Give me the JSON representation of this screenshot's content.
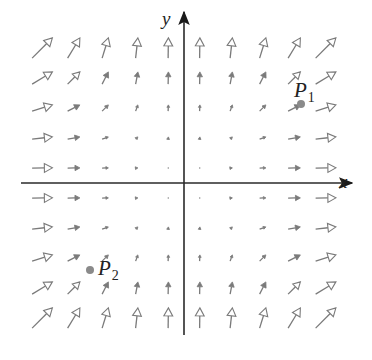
{
  "diagram": {
    "type": "vector_field",
    "field_description": "F(x, y) = <x^2, y^2> approximately",
    "origin_px": [
      184,
      183
    ],
    "unit_px": [
      31.5,
      30
    ],
    "arrow_scale": 1.0,
    "colors": {
      "axis": "#2a2a2a",
      "arrow": "#7a7a7a",
      "point": "#8a8a8a",
      "text": "#222222"
    },
    "axes": {
      "x": {
        "label": "x",
        "from_px": [
          21,
          183
        ],
        "to_px": [
          352,
          183
        ],
        "label_px": [
          339,
          172
        ]
      },
      "y": {
        "label": "y",
        "from_px": [
          184,
          335
        ],
        "to_px": [
          184,
          12
        ],
        "label_px": [
          162,
          9
        ]
      }
    },
    "grid": {
      "x_values": [
        -4.5,
        -3.5,
        -2.5,
        -1.5,
        -0.5,
        0.5,
        1.5,
        2.5,
        3.5,
        4.5
      ],
      "y_values": [
        4.5,
        3.5,
        2.5,
        1.5,
        0.5,
        -0.5,
        -1.5,
        -2.5,
        -3.5,
        -4.5
      ]
    },
    "points": [
      {
        "name": "P",
        "subscript": "1",
        "dot_px": [
          301,
          104
        ],
        "label_px": [
          294,
          80
        ]
      },
      {
        "name": "P",
        "subscript": "2",
        "dot_px": [
          90,
          270
        ],
        "label_px": [
          98,
          258
        ]
      }
    ]
  }
}
